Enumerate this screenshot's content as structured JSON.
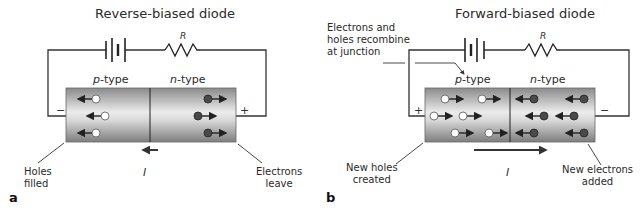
{
  "panels": [
    {
      "id": "a",
      "letter": "a",
      "title": "Reverse-biased diode",
      "resistor_label": "R",
      "p_region": {
        "prefix": "p",
        "suffix": "-type"
      },
      "n_region": {
        "prefix": "n",
        "suffix": "-type"
      },
      "left_terminal_sign": "−",
      "right_terminal_sign": "+",
      "current_label": "I",
      "current_direction": "left",
      "left_annotation": [
        "Holes",
        "filled"
      ],
      "right_annotation": [
        "Electrons",
        "leave"
      ],
      "holes": [
        {
          "x": 96,
          "y": 99,
          "arrow": "left"
        },
        {
          "x": 105,
          "y": 116,
          "arrow": "left"
        },
        {
          "x": 96,
          "y": 133,
          "arrow": "left"
        }
      ],
      "electrons": [
        {
          "x": 208,
          "y": 99,
          "arrow": "right"
        },
        {
          "x": 198,
          "y": 116,
          "arrow": "right"
        },
        {
          "x": 208,
          "y": 133,
          "arrow": "right"
        }
      ]
    },
    {
      "id": "b",
      "letter": "b",
      "title": "Forward-biased diode",
      "resistor_label": "R",
      "p_region": {
        "prefix": "p",
        "suffix": "-type"
      },
      "n_region": {
        "prefix": "n",
        "suffix": "-type"
      },
      "left_terminal_sign": "+",
      "right_terminal_sign": "−",
      "current_label": "I",
      "current_direction": "right",
      "top_annotation": [
        "Electrons and",
        "holes recombine",
        "at junction"
      ],
      "left_annotation": [
        "New holes",
        "created"
      ],
      "right_annotation": [
        "New electrons",
        "added"
      ],
      "holes": [
        {
          "x": 445,
          "y": 99,
          "arrow": "right"
        },
        {
          "x": 482,
          "y": 99,
          "arrow": "right"
        },
        {
          "x": 434,
          "y": 116,
          "arrow": "right"
        },
        {
          "x": 463,
          "y": 116,
          "arrow": "right"
        },
        {
          "x": 455,
          "y": 133,
          "arrow": "right"
        },
        {
          "x": 489,
          "y": 133,
          "arrow": "right"
        }
      ],
      "electrons": [
        {
          "x": 534,
          "y": 99,
          "arrow": "left"
        },
        {
          "x": 584,
          "y": 99,
          "arrow": "left"
        },
        {
          "x": 544,
          "y": 116,
          "arrow": "left"
        },
        {
          "x": 574,
          "y": 116,
          "arrow": "left"
        },
        {
          "x": 534,
          "y": 133,
          "arrow": "left"
        },
        {
          "x": 584,
          "y": 133,
          "arrow": "left"
        }
      ]
    }
  ],
  "colors": {
    "hole_fill": "#ffffff",
    "electron_fill": "#4a4a4a",
    "bar_dark": "#8a8a8a",
    "bar_light": "#e6e6e6",
    "wire": "#333333"
  }
}
